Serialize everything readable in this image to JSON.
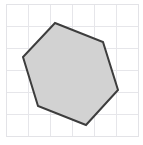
{
  "figure": {
    "type": "geometry-diagram",
    "canvas": {
      "width": 143,
      "height": 145
    },
    "background_color": "#ffffff"
  },
  "grid": {
    "visible": true,
    "line_color": "#e6e6ea",
    "line_width": 1,
    "cell_size": 22,
    "origin_x": 6,
    "origin_y": 4,
    "columns": 6,
    "rows": 6,
    "x_lines": [
      6,
      28,
      50,
      72,
      94,
      116,
      138
    ],
    "y_lines": [
      4,
      26,
      48,
      70,
      92,
      114,
      136
    ]
  },
  "border": {
    "visible": true,
    "color": "#e3e3e7",
    "width": 1,
    "x": 6,
    "y": 4,
    "w": 132,
    "h": 132
  },
  "shape": {
    "name": "hexagon",
    "sides": 6,
    "fill_color": "#d2d2d2",
    "stroke_color": "#3d3d3d",
    "stroke_width": 2,
    "points_attr": "55,23 103,42 118,90 86,125 38,106 23,57",
    "vertices": [
      {
        "label": "A",
        "x": 55,
        "y": 23
      },
      {
        "label": "B",
        "x": 103,
        "y": 42
      },
      {
        "label": "C",
        "x": 118,
        "y": 90
      },
      {
        "label": "D",
        "x": 86,
        "y": 125
      },
      {
        "label": "E",
        "x": 38,
        "y": 106
      },
      {
        "label": "F",
        "x": 23,
        "y": 57
      }
    ]
  }
}
